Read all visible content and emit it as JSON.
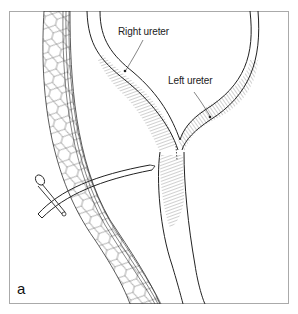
{
  "figure": {
    "panel_letter": "a",
    "labels": {
      "right_ureter": "Right ureter",
      "left_ureter": "Left ureter"
    },
    "colors": {
      "line": "#222222",
      "frame": "#aaaaaa",
      "background": "#ffffff"
    }
  }
}
